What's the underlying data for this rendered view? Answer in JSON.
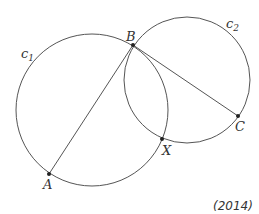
{
  "diagram": {
    "circles": [
      {
        "name": "c1",
        "label": "c",
        "subscript": "1",
        "cx": 92,
        "cy": 110,
        "r": 76
      },
      {
        "name": "c2",
        "label": "c",
        "subscript": "2",
        "cx": 187,
        "cy": 80,
        "r": 63
      }
    ],
    "points": {
      "A": {
        "label": "A",
        "x": 49,
        "y": 174
      },
      "B": {
        "label": "B",
        "x": 133,
        "y": 45
      },
      "C": {
        "label": "C",
        "x": 238,
        "y": 116
      },
      "X": {
        "label": "X",
        "x": 162,
        "y": 139
      }
    },
    "segments": [
      [
        "A",
        "B"
      ],
      [
        "B",
        "C"
      ]
    ],
    "caption": "(2014)",
    "stroke_color": "#555555"
  }
}
